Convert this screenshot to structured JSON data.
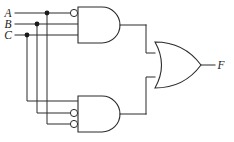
{
  "diagram": {
    "background_color": "#ffffff",
    "line_color": "#2b2b2b",
    "label_color": "#1a1a1a"
  },
  "inputs": [
    {
      "id": "A",
      "label": "A",
      "label_x": 8,
      "label_y": 17,
      "wire_y": 13,
      "tap_x": 47
    },
    {
      "id": "B",
      "label": "B",
      "label_x": 8,
      "label_y": 28,
      "wire_y": 24,
      "tap_x": 37
    },
    {
      "id": "C",
      "label": "C",
      "label_x": 8,
      "label_y": 39,
      "wire_y": 35,
      "tap_x": 27
    }
  ],
  "output": {
    "id": "F",
    "label": "F",
    "label_x": 221,
    "label_y": 69,
    "wire_y": 65
  },
  "gates": [
    {
      "id": "and-top",
      "type": "AND",
      "label": "AND",
      "x": 78,
      "y": 7,
      "width": 42,
      "height": 36,
      "inputs": [
        {
          "source": "A",
          "y": 13,
          "inverted": true
        },
        {
          "source": "B",
          "y": 24,
          "inverted": false
        },
        {
          "source": "C",
          "y": 35,
          "inverted": false
        }
      ],
      "output_y": 25,
      "expression": "A' · B · C"
    },
    {
      "id": "and-bottom",
      "type": "AND",
      "label": "AND",
      "x": 78,
      "y": 96,
      "width": 42,
      "height": 36,
      "inputs": [
        {
          "source": "C",
          "y": 101,
          "inverted": false
        },
        {
          "source": "B",
          "y": 113,
          "inverted": true
        },
        {
          "source": "A",
          "y": 124,
          "inverted": true
        }
      ],
      "output_y": 114,
      "expression": "A · B' · C'"
    },
    {
      "id": "or-output",
      "type": "OR",
      "label": "OR",
      "x": 155,
      "y": 42,
      "width": 46,
      "height": 46,
      "inputs": [
        {
          "source": "and-top",
          "y": 53
        },
        {
          "source": "and-bottom",
          "y": 77
        }
      ],
      "output_y": 65,
      "expression": "F = A'BC + AB'C'"
    }
  ],
  "junctions": [
    {
      "on": "A",
      "x": 47,
      "y": 13
    },
    {
      "on": "B",
      "x": 37,
      "y": 24
    },
    {
      "on": "C",
      "x": 27,
      "y": 35
    }
  ],
  "routing": {
    "bus_left_x": 27,
    "bus_mid_x": 37,
    "bus_right_x": 47,
    "and_out_x": 146,
    "or_in_x": 155
  }
}
